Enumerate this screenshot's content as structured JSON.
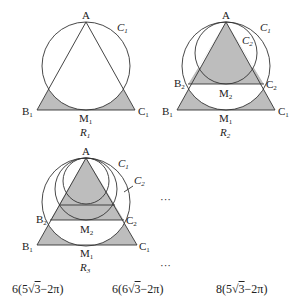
{
  "figures": [
    {
      "id": "R1",
      "caption": "R",
      "caption_sub": "1",
      "labels": {
        "A": "A",
        "B1": "B",
        "B1_sub": "1",
        "C1_pt": "C",
        "C1_pt_sub": "1",
        "M1": "M",
        "M1_sub": "1",
        "circle1": "C",
        "circle1_sub": "1"
      }
    },
    {
      "id": "R2",
      "caption": "R",
      "caption_sub": "2",
      "labels": {
        "A": "A",
        "B1": "B",
        "B1_sub": "1",
        "C1_pt": "C",
        "C1_pt_sub": "1",
        "B2": "B",
        "B2_sub": "2",
        "C2_pt": "C",
        "C2_pt_sub": "2",
        "M1": "M",
        "M1_sub": "1",
        "M2": "M",
        "M2_sub": "2",
        "circle1": "C",
        "circle1_sub": "1",
        "circle2": "C",
        "circle2_sub": "2"
      }
    },
    {
      "id": "R3",
      "caption": "R",
      "caption_sub": "3",
      "labels": {
        "A": "A",
        "B1": "B",
        "B1_sub": "1",
        "C1_pt": "C",
        "C1_pt_sub": "1",
        "B2": "B",
        "B2_sub": "2",
        "C2_pt": "C",
        "C2_pt_sub": "2",
        "M1": "M",
        "M1_sub": "1",
        "M2": "M",
        "M2_sub": "2",
        "circle1": "C",
        "circle1_sub": "1",
        "circle2": "C",
        "circle2_sub": "2"
      }
    }
  ],
  "ellipsis": {
    "right_of_R3": "···",
    "below_R3": "···"
  },
  "answer_choices": [
    {
      "coef": "6",
      "open": "(",
      "a": "5",
      "root": "3",
      "rest": "−2π",
      "close": ")"
    },
    {
      "coef": "6",
      "open": "(",
      "a": "6",
      "root": "3",
      "rest": "−2π",
      "close": ")"
    },
    {
      "coef": "8",
      "open": "(",
      "a": "5",
      "root": "3",
      "rest": "−2π",
      "close": ")"
    }
  ],
  "colors": {
    "shade": "#bdbdbd",
    "stroke": "#333333",
    "background": "#ffffff"
  }
}
